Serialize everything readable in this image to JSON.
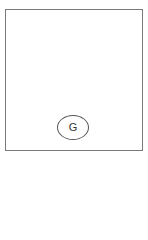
{
  "diagram": {
    "frame": {
      "border_color": "#7a7a7a"
    },
    "nodes": [
      {
        "id": "G",
        "label": "G",
        "shape": "ellipse"
      }
    ]
  }
}
